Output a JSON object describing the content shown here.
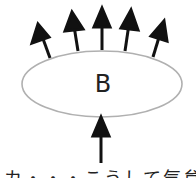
{
  "diagram": {
    "body_label": "B",
    "caption_partial": "カ・・・こうして気怠い虫激",
    "colors": {
      "ellipse_stroke": "#b0b0b0",
      "arrow": "#111111",
      "text": "#222222"
    },
    "ellipse": {
      "cx": 102,
      "cy": 84,
      "rx": 80,
      "ry": 33
    },
    "outgoing_arrows": [
      {
        "from": [
          50,
          58
        ],
        "to": [
          38,
          24
        ]
      },
      {
        "from": [
          78,
          51
        ],
        "to": [
          72,
          12
        ]
      },
      {
        "from": [
          102,
          50
        ],
        "to": [
          102,
          8
        ]
      },
      {
        "from": [
          125,
          51
        ],
        "to": [
          131,
          10
        ]
      },
      {
        "from": [
          153,
          57
        ],
        "to": [
          164,
          21
        ]
      }
    ],
    "incoming_arrow": {
      "from": [
        101,
        163
      ],
      "to": [
        101,
        117
      ]
    }
  }
}
